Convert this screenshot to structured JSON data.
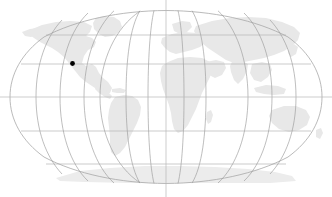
{
  "widget": {
    "name": "world-map-locator",
    "width": 332,
    "height": 197,
    "background_color": "#ffffff"
  },
  "map": {
    "title": "World Map",
    "projection": "Robinson",
    "land_color": "#e8e8e8",
    "ocean_color": "#ffffff",
    "outline_color": "#a8a8a8",
    "graticule_color": "#9a9a9a",
    "parallel_color": "#b5b5b5",
    "axis_color": "#b8b8b8",
    "center_x": 166,
    "center_y": 97,
    "radius_x": 156,
    "radius_y": 86.5,
    "graticule": {
      "meridian_interval_degrees": 30,
      "parallel_interval_degrees": 30,
      "meridian_count": 13,
      "meridians_degrees": [
        -180,
        -150,
        -120,
        -90,
        -60,
        -30,
        0,
        30,
        60,
        90,
        120,
        150,
        180
      ],
      "parallels_degrees": [
        60,
        30,
        0,
        -30,
        -60
      ],
      "parallel_labels": [
        "60N",
        "30N",
        "0",
        "30S",
        "60S"
      ],
      "central_meridian_degrees": 0,
      "equator_label": "Equator"
    },
    "axes": {
      "central_meridian_x": 166,
      "equator_y": 97,
      "extends_beyond_frame": true
    }
  },
  "marker": {
    "name": "location-marker",
    "label": "Selected location",
    "color": "#000000",
    "x": 72.5,
    "y": 63.5,
    "radius": 2.4,
    "latitude": "38N",
    "longitude": "122W",
    "region": "North America"
  },
  "landmasses": [
    {
      "name": "north-america"
    },
    {
      "name": "greenland"
    },
    {
      "name": "south-america"
    },
    {
      "name": "africa"
    },
    {
      "name": "europe"
    },
    {
      "name": "asia"
    },
    {
      "name": "australia"
    },
    {
      "name": "antarctica"
    }
  ]
}
